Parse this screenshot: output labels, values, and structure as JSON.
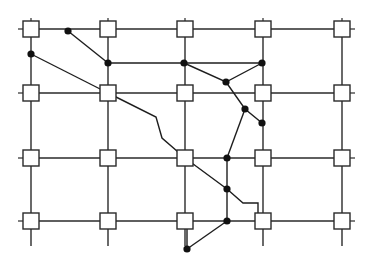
{
  "diagram": {
    "type": "routing-grid",
    "colors": {
      "line": "#2a2a2a",
      "box_fill": "#ffffff",
      "via": "#111111"
    },
    "columns_x": [
      31,
      108,
      185,
      263,
      342
    ],
    "rows_y": [
      29,
      93,
      158,
      221
    ],
    "box_size": 16,
    "grid_extent": {
      "left": 20,
      "right": 352,
      "top": 20,
      "bottom": 246
    },
    "vias": [
      {
        "id": "A",
        "x": 68,
        "y": 31
      },
      {
        "id": "B",
        "x": 31,
        "y": 54
      },
      {
        "id": "C",
        "x": 108,
        "y": 63
      },
      {
        "id": "D",
        "x": 184,
        "y": 63
      },
      {
        "id": "E",
        "x": 226,
        "y": 82
      },
      {
        "id": "F",
        "x": 262,
        "y": 63
      },
      {
        "id": "G",
        "x": 245,
        "y": 109
      },
      {
        "id": "H",
        "x": 262,
        "y": 123
      },
      {
        "id": "I",
        "x": 227,
        "y": 158
      },
      {
        "id": "J",
        "x": 227,
        "y": 189
      },
      {
        "id": "K",
        "x": 227,
        "y": 221
      },
      {
        "id": "L",
        "x": 187,
        "y": 249
      }
    ],
    "routes": [
      {
        "id": "r1",
        "points": "68,31 108,63"
      },
      {
        "id": "r2",
        "points": "31,54 108,93"
      },
      {
        "id": "r3",
        "points": "108,63 184,63 262,63"
      },
      {
        "id": "r4",
        "points": "184,63 226,82 262,63"
      },
      {
        "id": "r5",
        "points": "226,82 245,109 262,123"
      },
      {
        "id": "r6",
        "points": "245,109 227,158"
      },
      {
        "id": "r7",
        "points": "108,93 156,117 162,138 185,158"
      },
      {
        "id": "r8",
        "points": "185,158 227,189 243,203 258,203 258,213"
      },
      {
        "id": "r9",
        "points": "227,158 227,189 227,221"
      },
      {
        "id": "r10",
        "points": "227,221 187,249"
      },
      {
        "id": "r11",
        "points": "187,249 187,229"
      }
    ]
  }
}
